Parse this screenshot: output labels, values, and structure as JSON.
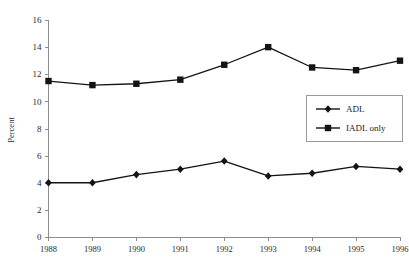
{
  "chart_data": {
    "type": "line",
    "title": "",
    "xlabel": "",
    "ylabel": "Percent",
    "categories": [
      "1988",
      "1989",
      "1990",
      "1991",
      "1992",
      "1993",
      "1994",
      "1995",
      "1996"
    ],
    "ylim": [
      0,
      16
    ],
    "ytick_step": 2,
    "yticks": [
      "0",
      "2",
      "4",
      "6",
      "8",
      "10",
      "12",
      "14",
      "16"
    ],
    "grid": false,
    "legend_position": "middle-right",
    "series": [
      {
        "name": "ADL",
        "marker": "diamond",
        "color": "#141414",
        "values": [
          4.0,
          4.0,
          4.6,
          5.0,
          5.6,
          4.5,
          4.7,
          5.2,
          5.0
        ]
      },
      {
        "name": "IADL only",
        "marker": "square",
        "color": "#141414",
        "values": [
          11.5,
          11.2,
          11.3,
          11.6,
          12.7,
          14.0,
          12.5,
          12.3,
          13.0
        ]
      }
    ]
  },
  "legend": {
    "entries": [
      {
        "label": "ADL",
        "marker": "diamond"
      },
      {
        "label": "IADL only",
        "marker": "square"
      }
    ]
  }
}
